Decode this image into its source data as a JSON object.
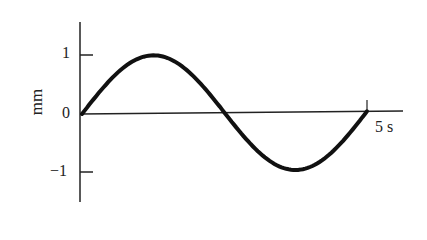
{
  "chart_data": {
    "type": "line",
    "title": "",
    "xlabel": "",
    "ylabel": "mm",
    "x_end_label": "5 s",
    "yticks": [
      "1",
      "0",
      "−1"
    ],
    "ylim": [
      -1.5,
      1.5
    ],
    "xlim": [
      0,
      5
    ],
    "grid": false,
    "series": [
      {
        "name": "displacement",
        "function": "sin(2*pi*t/5)",
        "x": [
          0,
          0.625,
          1.25,
          1.875,
          2.5,
          3.125,
          3.75,
          4.375,
          5
        ],
        "y": [
          0,
          0.71,
          1,
          0.71,
          0,
          -0.71,
          -1,
          -0.71,
          0
        ]
      }
    ]
  }
}
